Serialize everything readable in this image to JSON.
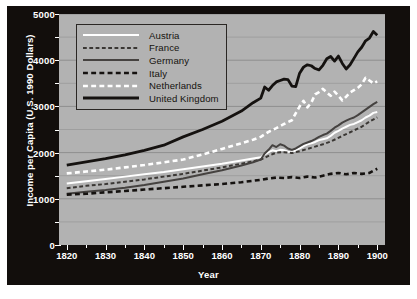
{
  "chart_data": {
    "type": "line",
    "title": "",
    "xlabel": "Year",
    "ylabel": "Income per Capita (U.S. 1990 Dollars)",
    "xlim": [
      1818,
      1902
    ],
    "ylim": [
      0,
      5000
    ],
    "xticks": [
      1820,
      1830,
      1840,
      1850,
      1860,
      1870,
      1880,
      1890,
      1900
    ],
    "yticks": [
      0,
      1000,
      2000,
      3000,
      4000,
      5000
    ],
    "yminorticks": [
      500,
      1500,
      2500,
      3500,
      4500
    ],
    "grid": true,
    "legend_position": "upper-left",
    "plot_background": "#b2b2b2",
    "frame_background": "#120e0c",
    "gridline_color": "#8f8f8f",
    "series": [
      {
        "name": "Austria",
        "style": "solid",
        "color": "#ffffff",
        "width": 2.0,
        "x": [
          1820,
          1825,
          1830,
          1835,
          1840,
          1845,
          1850,
          1855,
          1860,
          1865,
          1868,
          1870,
          1871,
          1872,
          1873,
          1874,
          1875,
          1876,
          1877,
          1878,
          1879,
          1880,
          1881,
          1882,
          1883,
          1884,
          1885,
          1886,
          1887,
          1888,
          1889,
          1890,
          1891,
          1892,
          1893,
          1894,
          1895,
          1896,
          1897,
          1898,
          1899,
          1900
        ],
        "y": [
          1330,
          1380,
          1430,
          1480,
          1530,
          1580,
          1640,
          1700,
          1760,
          1830,
          1870,
          1900,
          1960,
          2010,
          2050,
          2030,
          2060,
          2050,
          2020,
          2010,
          2050,
          2090,
          2140,
          2180,
          2200,
          2230,
          2270,
          2290,
          2310,
          2360,
          2430,
          2470,
          2520,
          2560,
          2600,
          2620,
          2660,
          2700,
          2760,
          2800,
          2860,
          2880
        ]
      },
      {
        "name": "France",
        "style": "dashed",
        "color": "#3a3734",
        "width": 2.0,
        "x": [
          1820,
          1825,
          1830,
          1835,
          1840,
          1845,
          1850,
          1855,
          1860,
          1865,
          1868,
          1870,
          1872,
          1874,
          1876,
          1878,
          1880,
          1882,
          1884,
          1886,
          1888,
          1890,
          1892,
          1894,
          1896,
          1898,
          1900
        ],
        "y": [
          1230,
          1280,
          1320,
          1370,
          1420,
          1480,
          1540,
          1610,
          1680,
          1760,
          1810,
          1850,
          1930,
          2000,
          2010,
          1990,
          2030,
          2080,
          2130,
          2180,
          2240,
          2320,
          2400,
          2480,
          2560,
          2670,
          2760
        ]
      },
      {
        "name": "Germany",
        "style": "solid",
        "color": "#454240",
        "width": 2.0,
        "x": [
          1820,
          1825,
          1830,
          1835,
          1840,
          1845,
          1850,
          1855,
          1860,
          1865,
          1868,
          1870,
          1871,
          1872,
          1873,
          1874,
          1875,
          1876,
          1877,
          1878,
          1879,
          1880,
          1881,
          1882,
          1883,
          1884,
          1885,
          1886,
          1887,
          1888,
          1889,
          1890,
          1891,
          1892,
          1893,
          1894,
          1895,
          1896,
          1897,
          1898,
          1899,
          1900
        ],
        "y": [
          1110,
          1150,
          1190,
          1240,
          1300,
          1370,
          1440,
          1530,
          1620,
          1720,
          1790,
          1850,
          1980,
          2060,
          2160,
          2120,
          2180,
          2150,
          2090,
          2060,
          2090,
          2140,
          2190,
          2220,
          2250,
          2290,
          2340,
          2380,
          2410,
          2470,
          2540,
          2590,
          2650,
          2690,
          2730,
          2760,
          2810,
          2870,
          2930,
          2990,
          3050,
          3100
        ]
      },
      {
        "name": "Italy",
        "style": "dashed",
        "color": "#151210",
        "width": 2.6,
        "x": [
          1820,
          1825,
          1830,
          1835,
          1840,
          1845,
          1850,
          1855,
          1860,
          1865,
          1868,
          1870,
          1872,
          1874,
          1876,
          1878,
          1880,
          1882,
          1884,
          1886,
          1888,
          1890,
          1892,
          1894,
          1896,
          1898,
          1900
        ],
        "y": [
          1090,
          1110,
          1140,
          1170,
          1200,
          1230,
          1260,
          1290,
          1320,
          1360,
          1390,
          1410,
          1440,
          1460,
          1450,
          1470,
          1450,
          1480,
          1460,
          1500,
          1540,
          1560,
          1530,
          1560,
          1540,
          1560,
          1650
        ]
      },
      {
        "name": "Netherlands",
        "style": "dashed",
        "color": "#ffffff",
        "width": 2.6,
        "x": [
          1820,
          1825,
          1830,
          1835,
          1840,
          1845,
          1850,
          1855,
          1860,
          1865,
          1868,
          1870,
          1872,
          1874,
          1876,
          1878,
          1880,
          1881,
          1882,
          1883,
          1884,
          1885,
          1886,
          1887,
          1888,
          1889,
          1890,
          1891,
          1892,
          1893,
          1894,
          1895,
          1896,
          1897,
          1898,
          1899,
          1900
        ],
        "y": [
          1550,
          1590,
          1630,
          1680,
          1730,
          1790,
          1850,
          1960,
          2080,
          2200,
          2280,
          2340,
          2450,
          2530,
          2620,
          2700,
          3000,
          3120,
          2980,
          3080,
          3260,
          3310,
          3380,
          3300,
          3230,
          3320,
          3230,
          3130,
          3210,
          3300,
          3350,
          3400,
          3480,
          3620,
          3560,
          3500,
          3540
        ]
      },
      {
        "name": "United Kingdom",
        "style": "solid",
        "color": "#151210",
        "width": 2.8,
        "x": [
          1820,
          1825,
          1830,
          1835,
          1840,
          1845,
          1850,
          1855,
          1860,
          1865,
          1868,
          1870,
          1871,
          1872,
          1873,
          1874,
          1875,
          1876,
          1877,
          1878,
          1879,
          1880,
          1881,
          1882,
          1883,
          1884,
          1885,
          1886,
          1887,
          1888,
          1889,
          1890,
          1891,
          1892,
          1893,
          1894,
          1895,
          1896,
          1897,
          1898,
          1899,
          1900
        ],
        "y": [
          1730,
          1800,
          1870,
          1950,
          2050,
          2160,
          2340,
          2500,
          2680,
          2900,
          3080,
          3180,
          3420,
          3350,
          3450,
          3530,
          3560,
          3590,
          3580,
          3440,
          3430,
          3720,
          3850,
          3900,
          3880,
          3820,
          3790,
          3890,
          4030,
          4080,
          3980,
          4090,
          3930,
          3810,
          3900,
          4040,
          4180,
          4280,
          4420,
          4480,
          4620,
          4540
        ]
      }
    ]
  },
  "legend": {
    "entries": [
      {
        "label": "Austria"
      },
      {
        "label": "France"
      },
      {
        "label": "Germany"
      },
      {
        "label": "Italy"
      },
      {
        "label": "Netherlands"
      },
      {
        "label": "United Kingdom"
      }
    ]
  }
}
